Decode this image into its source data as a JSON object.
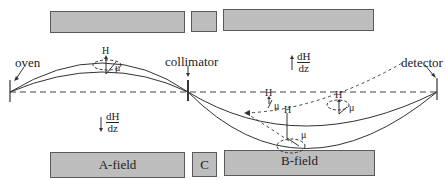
{
  "figure": {
    "labels": {
      "oven": "oven",
      "collimator": "collimator",
      "detector": "detector"
    },
    "blocks": {
      "top": [
        {
          "id": "a-field-top",
          "label": ""
        },
        {
          "id": "c-top",
          "label": ""
        },
        {
          "id": "b-field-top",
          "label": ""
        }
      ],
      "bottom": [
        {
          "id": "a-field-bottom",
          "label": "A-field"
        },
        {
          "id": "c-bottom",
          "label": "C"
        },
        {
          "id": "b-field-bottom",
          "label": "B-field"
        }
      ]
    },
    "gradients": {
      "a_region": {
        "num": "dH",
        "den": "dz",
        "direction": "down"
      },
      "b_region": {
        "num": "dH",
        "den": "dz",
        "direction": "up"
      }
    },
    "vector_labels": {
      "H": "H",
      "mu": "μ"
    },
    "colors": {
      "block_fill": "#bdbdbd",
      "block_border": "#5a5a5a",
      "line": "#333333"
    }
  }
}
